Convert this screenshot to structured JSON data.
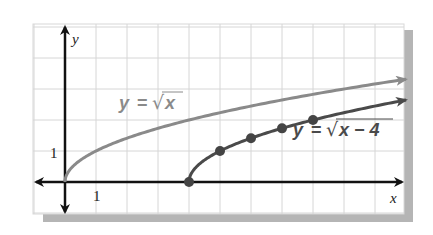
{
  "chart_data": {
    "type": "line",
    "title": "",
    "xlabel": "x",
    "ylabel": "y",
    "xlim": [
      -1,
      11
    ],
    "ylim": [
      -1,
      5
    ],
    "grid": true,
    "unit_px": 31,
    "x_tick_label": "1",
    "y_tick_label": "1",
    "series": [
      {
        "name": "y = √x",
        "label_parts": {
          "lhs": "y",
          "eq": "=",
          "radicand": "x"
        },
        "color": "#8a8a8a",
        "function": "sqrt(x)",
        "domain": [
          0,
          11
        ],
        "points": [
          [
            0,
            0
          ],
          [
            1,
            1
          ],
          [
            4,
            2
          ],
          [
            9,
            3
          ],
          [
            11,
            3.32
          ]
        ]
      },
      {
        "name": "y = √(x − 4)",
        "label_parts": {
          "lhs": "y",
          "eq": "=",
          "radicand": "x − 4"
        },
        "color": "#4a4a4a",
        "function": "sqrt(x-4)",
        "domain": [
          4,
          11
        ],
        "marked_points": [
          [
            4,
            0
          ],
          [
            5,
            1
          ],
          [
            6,
            1.41
          ],
          [
            7,
            1.73
          ],
          [
            8,
            2
          ]
        ],
        "points": [
          [
            4,
            0
          ],
          [
            5,
            1
          ],
          [
            6,
            1.41
          ],
          [
            7,
            1.73
          ],
          [
            8,
            2
          ],
          [
            11,
            2.65
          ]
        ]
      }
    ]
  }
}
